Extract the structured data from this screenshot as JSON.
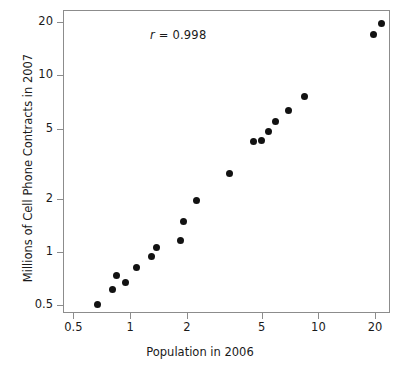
{
  "chart_data": {
    "type": "scatter",
    "title": "",
    "xlabel": "Population in 2006",
    "ylabel": "Millions of Cell Phone Contracts in 2007",
    "xscale": "log",
    "yscale": "log",
    "xlim": [
      0.44,
      24.0
    ],
    "ylim": [
      0.45,
      23.5
    ],
    "grid": false,
    "legend": null,
    "annotations": [
      {
        "name": "correlation",
        "symbol": "r",
        "text": " = 0.998",
        "full_text": "r = 0.998",
        "value": 0.998
      }
    ],
    "xticks": [
      {
        "value": 0.5,
        "label": "0.5"
      },
      {
        "value": 1,
        "label": "1"
      },
      {
        "value": 2,
        "label": "2"
      },
      {
        "value": 5,
        "label": "5"
      },
      {
        "value": 10,
        "label": "10"
      },
      {
        "value": 20,
        "label": "20"
      }
    ],
    "yticks": [
      {
        "value": 0.5,
        "label": "0.5"
      },
      {
        "value": 1,
        "label": "1"
      },
      {
        "value": 2,
        "label": "2"
      },
      {
        "value": 5,
        "label": "5"
      },
      {
        "value": 10,
        "label": "10"
      },
      {
        "value": 20,
        "label": "20"
      }
    ],
    "marker": {
      "shape": "circle",
      "color": "#121212",
      "size_px": 7
    },
    "points": [
      {
        "x": 0.66,
        "y": 0.51
      },
      {
        "x": 0.8,
        "y": 0.62
      },
      {
        "x": 0.84,
        "y": 0.74
      },
      {
        "x": 0.93,
        "y": 0.68
      },
      {
        "x": 1.07,
        "y": 0.83
      },
      {
        "x": 1.28,
        "y": 0.95
      },
      {
        "x": 1.37,
        "y": 1.07
      },
      {
        "x": 1.84,
        "y": 1.18
      },
      {
        "x": 1.9,
        "y": 1.5
      },
      {
        "x": 2.22,
        "y": 1.98
      },
      {
        "x": 3.35,
        "y": 2.82
      },
      {
        "x": 4.45,
        "y": 4.3
      },
      {
        "x": 4.95,
        "y": 4.32
      },
      {
        "x": 5.35,
        "y": 4.88
      },
      {
        "x": 5.85,
        "y": 5.55
      },
      {
        "x": 6.85,
        "y": 6.4
      },
      {
        "x": 8.3,
        "y": 7.7
      },
      {
        "x": 19.4,
        "y": 17.2
      },
      {
        "x": 21.4,
        "y": 20.0
      }
    ]
  },
  "axis": {
    "y_title": "Millions of Cell Phone Contracts in 2007",
    "x_title": "Population in 2006"
  },
  "colors": {
    "marker": "#121212",
    "frame": "#8c8c8c",
    "text": "#1a1a1a",
    "background": "#ffffff"
  }
}
